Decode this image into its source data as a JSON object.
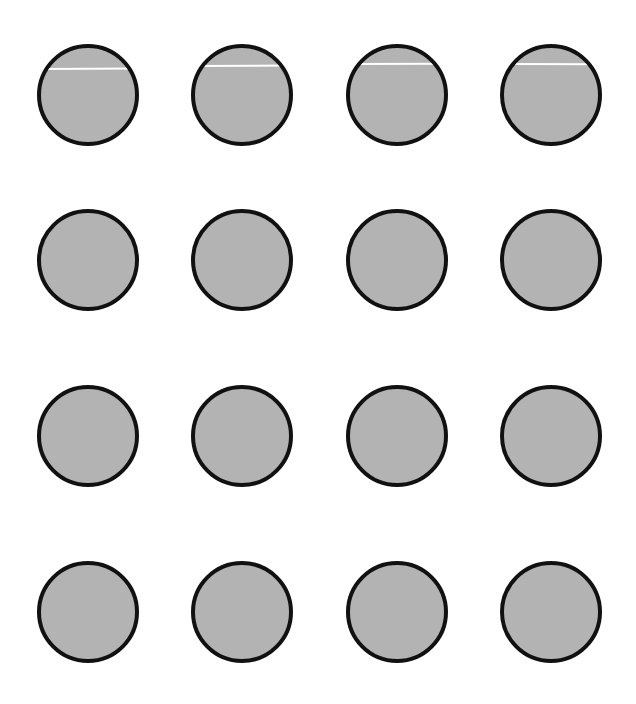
{
  "diagram": {
    "background": "#ffffff",
    "circle_style": {
      "fill": "#b3b3b3",
      "stroke": "#111111",
      "stroke_width": 4,
      "diameter": 102
    },
    "grid": {
      "rows": 4,
      "cols": 4
    },
    "circles": [
      {
        "row": 0,
        "col": 0,
        "cx": 88,
        "cy": 95,
        "line": {
          "y_offset": 24,
          "tilt_deg": -0.3
        }
      },
      {
        "row": 0,
        "col": 1,
        "cx": 242,
        "cy": 95,
        "line": {
          "y_offset": 21,
          "tilt_deg": -0.3
        }
      },
      {
        "row": 0,
        "col": 2,
        "cx": 397,
        "cy": 95,
        "line": {
          "y_offset": 19,
          "tilt_deg": -0.2
        }
      },
      {
        "row": 0,
        "col": 3,
        "cx": 551,
        "cy": 95,
        "line": {
          "y_offset": 19,
          "tilt_deg": 0.2
        }
      },
      {
        "row": 1,
        "col": 0,
        "cx": 88,
        "cy": 260
      },
      {
        "row": 1,
        "col": 1,
        "cx": 242,
        "cy": 260
      },
      {
        "row": 1,
        "col": 2,
        "cx": 397,
        "cy": 260
      },
      {
        "row": 1,
        "col": 3,
        "cx": 551,
        "cy": 260
      },
      {
        "row": 2,
        "col": 0,
        "cx": 88,
        "cy": 436
      },
      {
        "row": 2,
        "col": 1,
        "cx": 242,
        "cy": 436
      },
      {
        "row": 2,
        "col": 2,
        "cx": 397,
        "cy": 436
      },
      {
        "row": 2,
        "col": 3,
        "cx": 551,
        "cy": 436
      },
      {
        "row": 3,
        "col": 0,
        "cx": 88,
        "cy": 612
      },
      {
        "row": 3,
        "col": 1,
        "cx": 242,
        "cy": 612
      },
      {
        "row": 3,
        "col": 2,
        "cx": 397,
        "cy": 612
      },
      {
        "row": 3,
        "col": 3,
        "cx": 551,
        "cy": 612
      }
    ]
  }
}
